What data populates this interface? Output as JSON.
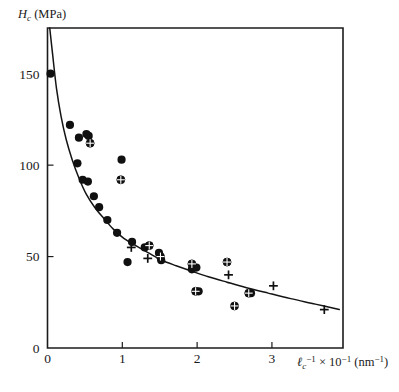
{
  "figure": {
    "background_color": "#ffffff",
    "ink_color": "#101010"
  },
  "chart_data": {
    "type": "scatter",
    "title": "",
    "subtitle": "",
    "xlabel": "ℓc⁻¹ × 10⁻¹ (nm⁻¹)",
    "ylabel": "Hc (MPa)",
    "ylabel_parts": {
      "symbol": "H",
      "subscript": "c",
      "unit": "(MPa)"
    },
    "xlabel_parts": {
      "symbol": "ℓ",
      "symbol_subscript": "c",
      "symbol_superscript": "−1",
      "times": "×",
      "scale_base": "10",
      "scale_exponent": "−1",
      "unit_open": "(nm",
      "unit_exponent": "−1",
      "unit_close": ")"
    },
    "xlim": [
      0,
      3.95
    ],
    "ylim": [
      0,
      175
    ],
    "xticks": [
      0,
      1,
      2,
      3
    ],
    "xticklabels": [
      "0",
      "1",
      "2",
      "3"
    ],
    "yticks": [
      0,
      50,
      100,
      150
    ],
    "yticklabels": [
      "0",
      "50",
      "100",
      "150"
    ],
    "grid": false,
    "legend": "none",
    "frame": "box",
    "tick_direction": "in",
    "series": [
      {
        "name": "filled-circle",
        "marker": "filled-circle",
        "points": [
          [
            0.04,
            150
          ],
          [
            0.3,
            122
          ],
          [
            0.42,
            115
          ],
          [
            0.52,
            117
          ],
          [
            0.55,
            116
          ],
          [
            0.4,
            101
          ],
          [
            0.99,
            103
          ],
          [
            0.47,
            92
          ],
          [
            0.54,
            91
          ],
          [
            0.62,
            83
          ],
          [
            0.69,
            77
          ],
          [
            0.8,
            70
          ],
          [
            0.93,
            63
          ],
          [
            1.07,
            47
          ],
          [
            1.13,
            58
          ],
          [
            1.3,
            55
          ],
          [
            1.49,
            52
          ],
          [
            1.52,
            48
          ],
          [
            1.93,
            43
          ],
          [
            1.99,
            44
          ],
          [
            2.02,
            31
          ],
          [
            2.72,
            30
          ]
        ]
      },
      {
        "name": "crossed-circle",
        "marker": "crossed-circle",
        "points": [
          [
            0.57,
            112
          ],
          [
            0.98,
            92
          ],
          [
            1.36,
            56
          ],
          [
            1.51,
            50
          ],
          [
            1.93,
            46
          ],
          [
            1.98,
            31
          ],
          [
            2.4,
            47
          ],
          [
            2.5,
            23
          ],
          [
            2.69,
            30
          ]
        ]
      },
      {
        "name": "plus",
        "marker": "plus",
        "points": [
          [
            1.12,
            55
          ],
          [
            1.34,
            49
          ],
          [
            2.42,
            40
          ],
          [
            3.02,
            34
          ],
          [
            3.7,
            21
          ]
        ]
      }
    ],
    "fit_curve": {
      "name": "fit-curve",
      "description": "monotonically decreasing fitted curve",
      "points": [
        [
          0.03,
          175
        ],
        [
          0.07,
          160
        ],
        [
          0.12,
          142
        ],
        [
          0.18,
          127
        ],
        [
          0.25,
          114
        ],
        [
          0.33,
          103
        ],
        [
          0.42,
          93
        ],
        [
          0.52,
          84
        ],
        [
          0.63,
          77
        ],
        [
          0.75,
          71
        ],
        [
          0.88,
          65
        ],
        [
          1.02,
          60
        ],
        [
          1.18,
          56
        ],
        [
          1.35,
          52
        ],
        [
          1.53,
          48
        ],
        [
          1.72,
          45
        ],
        [
          1.93,
          42
        ],
        [
          2.15,
          39
        ],
        [
          2.4,
          36
        ],
        [
          2.66,
          33
        ],
        [
          2.95,
          30
        ],
        [
          3.25,
          27
        ],
        [
          3.58,
          24
        ],
        [
          3.9,
          21
        ]
      ]
    }
  }
}
